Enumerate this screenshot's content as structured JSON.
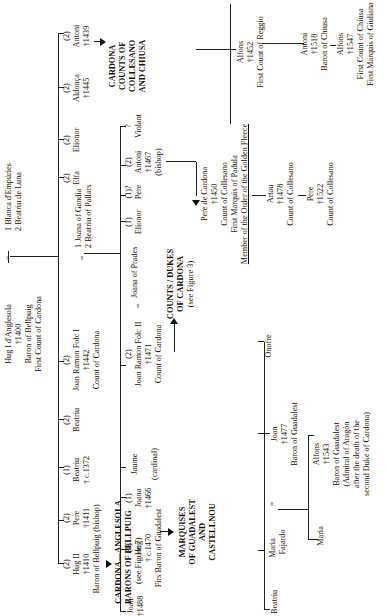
{
  "root": {
    "name": "Hug I d'Anglesola",
    "died": "†1400",
    "titles": [
      "Baron of Bellpuig",
      "First Count of Cardona"
    ],
    "spouses": [
      "1 Blanca d'Empúries",
      "2 Beatriu de Luna"
    ]
  },
  "children_gen1": [
    {
      "marriage": "(2)",
      "name": "Hug II",
      "died": "†1410",
      "note": "Baron of Bellpuig"
    },
    {
      "marriage": "(2)",
      "name": "Pere",
      "died": "†1411",
      "note": "(bishop)"
    },
    {
      "marriage": "(1)",
      "name": "Beatriu",
      "died": "† c.1372",
      "note": ""
    },
    {
      "marriage": "(2)",
      "name": "Beatriu",
      "died": "",
      "note": ""
    },
    {
      "marriage": "(2)",
      "name": "Joan Ramon Folc I",
      "died": "†1442",
      "note": "Count of Cardona",
      "spouses": [
        "1 Joana of Gandia",
        "2 Beatriu of Pallars"
      ]
    },
    {
      "marriage": "(2)",
      "name": "Elfa",
      "died": "",
      "note": ""
    },
    {
      "marriage": "(2)",
      "name": "Elionor",
      "died": "",
      "note": ""
    },
    {
      "marriage": "(2)",
      "name": "Aldonça",
      "died": "†1445",
      "note": ""
    },
    {
      "marriage": "(2)",
      "name": "Antoni",
      "died": "†1439",
      "note": ""
    }
  ],
  "branches": {
    "bellpuig": {
      "title": [
        "CARDONA—ANGLESOLA",
        "BARONS OF BELLPUIG"
      ],
      "ref": "(see Figure 7)"
    },
    "guadalest": {
      "title": [
        "MARQUISES",
        "OF GUADALEST",
        "AND",
        "CASTELLNOU"
      ]
    },
    "cardona": {
      "title": [
        "COUNTS / DUKES",
        "OF CARDONA"
      ],
      "ref": "(see Figure 3)"
    },
    "collesano": {
      "title": [
        "CARDONA",
        "COUNTS OF",
        "COLLESANO",
        "AND CHIUSA"
      ]
    }
  },
  "children_gen2": [
    {
      "marriage": "",
      "name": "Joan",
      "died": "†1488",
      "note": ""
    },
    {
      "marriage": "(1)",
      "name": "Hug",
      "died": "† c.1470",
      "note": "Firs Baron of Guadalest"
    },
    {
      "marriage": "(1)",
      "name": "Joana",
      "died": "†1466",
      "note": ""
    },
    {
      "marriage": "(1)",
      "name": "Jaume",
      "died": "",
      "note": "(cardinal)"
    },
    {
      "marriage": "(2)",
      "name": "Joan Ramon Folc II",
      "died": "†1471",
      "note": "Count of Cardona",
      "spouse": "Joana of Prades"
    },
    {
      "marriage": "(1)",
      "name": "Elionor",
      "died": "",
      "note": ""
    },
    {
      "marriage": "(1)?",
      "name": "Pere",
      "died": "",
      "note": ""
    },
    {
      "marriage": "(2)",
      "name": "Antoni",
      "died": "†1467",
      "note": "(bishop)"
    },
    {
      "marriage": "?",
      "name": "Violant",
      "died": "",
      "note": ""
    }
  ],
  "guadalest_line": {
    "children": [
      {
        "name": "Beatriu"
      },
      {
        "name": "Maria",
        "spouse_sym": "=",
        "spouse": "Joan",
        "spouse_died": "†1477",
        "spouse_note": "Baron of Guadalest"
      },
      {
        "name": "Onofre"
      }
    ],
    "maria_fajardo": "Maria Fajardo",
    "grandchildren": [
      {
        "name": "Maria"
      },
      {
        "name": "Alfons",
        "died": "†1543",
        "notes": [
          "Baron of Guadalest",
          "(Admiral of Aragón",
          "after the death of the",
          "second Duke of Cardona)"
        ]
      }
    ]
  },
  "collesano_line": {
    "pere": {
      "name": "Pere de Cardona",
      "died": "†1450",
      "notes": [
        "Count of Collesano",
        "First Marquis of Padula"
      ],
      "underlined": "Member of the Order of the Golden Fleece"
    },
    "alfons_reggio": {
      "name": "Alfons",
      "died": "†1452",
      "notes": [
        "First Count of Reggio"
      ]
    },
    "artau": {
      "name": "Artau",
      "died": "†1478",
      "notes": [
        "Count of Collesano"
      ]
    },
    "pere2": {
      "name": "Pere",
      "died": "†1522",
      "notes": [
        "Count of Collesano"
      ]
    },
    "antoni": {
      "name": "Antoni",
      "died": "†1518",
      "notes": [
        "Baron of Chiusa"
      ]
    },
    "alfons_chiusa": {
      "name": "Alfons",
      "died": "†1547",
      "notes": [
        "First Count of Chiusa",
        "First Marquis of Giuliana"
      ]
    }
  },
  "symbols": {
    "eq": "="
  }
}
